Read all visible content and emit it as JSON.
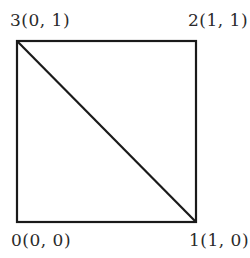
{
  "diagram": {
    "type": "unit-square-triangulation",
    "stroke_color": "#1a1a1a",
    "vertices": [
      {
        "index": "0",
        "label": "0(0, 0)",
        "coords": [
          0,
          0
        ]
      },
      {
        "index": "1",
        "label": "1(1, 0)",
        "coords": [
          1,
          0
        ]
      },
      {
        "index": "2",
        "label": "2(1, 1)",
        "coords": [
          1,
          1
        ]
      },
      {
        "index": "3",
        "label": "3(0, 1)",
        "coords": [
          0,
          1
        ]
      }
    ],
    "edges": [
      [
        "0",
        "1"
      ],
      [
        "1",
        "2"
      ],
      [
        "2",
        "3"
      ],
      [
        "3",
        "0"
      ],
      [
        "3",
        "1"
      ]
    ]
  }
}
